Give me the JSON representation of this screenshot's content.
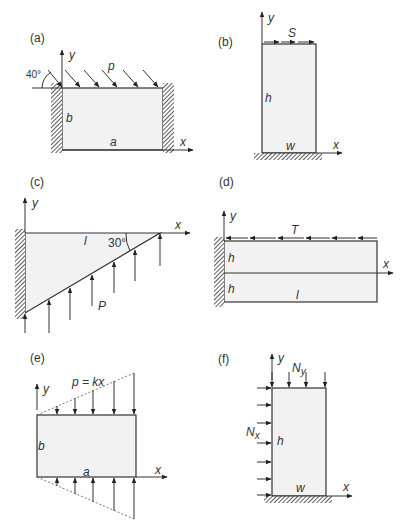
{
  "figure": {
    "panels": [
      {
        "id": "a",
        "label": "(a)",
        "axis_x": "x",
        "axis_y": "y",
        "load": "p",
        "angle": "40°",
        "width": "a",
        "height": "b",
        "support": "clamped left and right edges"
      },
      {
        "id": "b",
        "label": "(b)",
        "axis_x": "x",
        "axis_y": "y",
        "load": "S",
        "width": "w",
        "height": "h",
        "support": "clamped base"
      },
      {
        "id": "c",
        "label": "(c)",
        "axis_x": "x",
        "axis_y": "y",
        "load": "P",
        "angle": "30°",
        "length": "l",
        "support": "clamped left edge"
      },
      {
        "id": "d",
        "label": "(d)",
        "axis_x": "x",
        "axis_y": "y",
        "load": "T",
        "half_height_top": "h",
        "half_height_bottom": "h",
        "length": "l",
        "support": "clamped left edge"
      },
      {
        "id": "e",
        "label": "(e)",
        "axis_x": "x",
        "axis_y": "y",
        "load": "p = kx",
        "width": "a",
        "height": "b"
      },
      {
        "id": "f",
        "label": "(f)",
        "axis_x": "x",
        "axis_y": "y",
        "load_x": "N",
        "load_x_sub": "x",
        "load_y": "N",
        "load_y_sub": "y",
        "width": "w",
        "height": "h",
        "support": "clamped base"
      }
    ]
  }
}
